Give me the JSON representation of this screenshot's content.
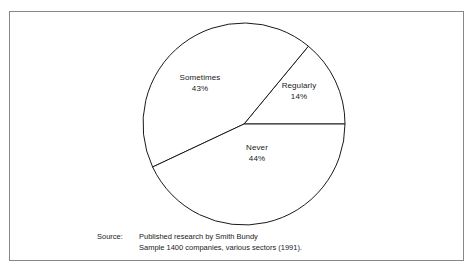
{
  "chart_data": {
    "type": "pie",
    "title": "",
    "subtitle": "",
    "xlabel": "",
    "ylabel": "",
    "categories": [
      "Regularly",
      "Never",
      "Sometimes"
    ],
    "values": [
      14,
      44,
      43
    ],
    "value_suffix": "%",
    "legend_position": "none",
    "grid": false,
    "slices": [
      {
        "name": "Regularly",
        "value": 14,
        "label": "Regularly",
        "value_label": "14%",
        "start_angle_deg": 0,
        "end_angle_deg": 50.4,
        "fill": "#ffffff",
        "stroke": "#1a1a1a"
      },
      {
        "name": "Sometimes",
        "value": 43,
        "label": "Sometimes",
        "value_label": "43%",
        "start_angle_deg": 50.4,
        "end_angle_deg": 205.2,
        "fill": "#ffffff",
        "stroke": "#1a1a1a"
      },
      {
        "name": "Never",
        "value": 44,
        "label": "Never",
        "value_label": "44%",
        "start_angle_deg": 205.2,
        "end_angle_deg": 360,
        "fill": "#ffffff",
        "stroke": "#1a1a1a"
      }
    ],
    "total": 101,
    "geometry": {
      "center_x": 244,
      "center_y": 124,
      "radius": 101
    }
  },
  "source": {
    "label": "Source:",
    "line1": "Published research by Smith Bundy",
    "line2": "Sample 1400 companies, various sectors (1991)."
  },
  "colors": {
    "frame_border": "#888888",
    "slice_outline": "#1a1a1a",
    "slice_fill": "#ffffff",
    "text": "#1a1a1a",
    "background": "#ffffff"
  }
}
